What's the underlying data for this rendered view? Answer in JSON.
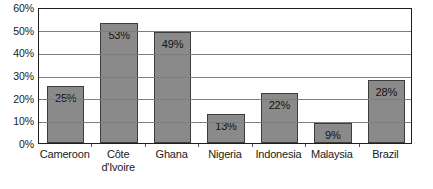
{
  "chart_data": {
    "type": "bar",
    "title": "",
    "xlabel": "",
    "ylabel": "",
    "categories": [
      "Cameroon",
      "Côte d'Ivoire",
      "Ghana",
      "Nigeria",
      "Indonesia",
      "Malaysia",
      "Brazil"
    ],
    "category_display": [
      "Cameroon",
      "Côte\nd'Ivoire",
      "Ghana",
      "Nigeria",
      "Indonesia",
      "Malaysia",
      "Brazil"
    ],
    "values": [
      25,
      53,
      49,
      13,
      22,
      9,
      28
    ],
    "value_labels": [
      "25%",
      "53%",
      "49%",
      "13%",
      "22%",
      "9%",
      "28%"
    ],
    "ylim": [
      0,
      60
    ],
    "ytick_values": [
      0,
      10,
      20,
      30,
      40,
      50,
      60
    ],
    "ytick_labels": [
      "0%",
      "10%",
      "20%",
      "30%",
      "40%",
      "50%",
      "60%"
    ],
    "grid": true,
    "grid_axis": "y",
    "legend": false,
    "legend_position": "none",
    "bar_color": "#8a8a8a",
    "bar_border_color": "#3d3d3d",
    "gridline_color": "#7d7d7d",
    "frame_color": "#1f1f1f",
    "background_color": "#ffffff",
    "text_color": "#1a1a1a"
  }
}
